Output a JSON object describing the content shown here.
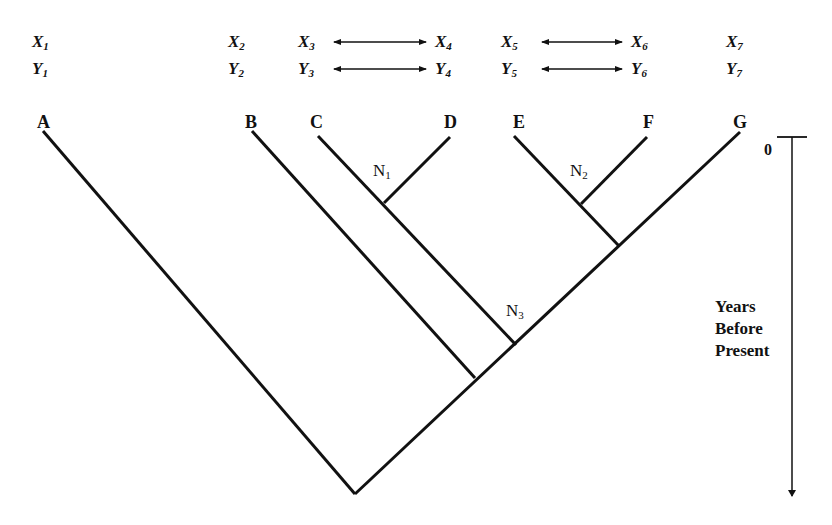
{
  "traits": [
    {
      "id": "t1",
      "x_label": "X",
      "y_label": "Y",
      "sub": "1",
      "left": 32
    },
    {
      "id": "t2",
      "x_label": "X",
      "y_label": "Y",
      "sub": "2",
      "left": 228
    },
    {
      "id": "t3",
      "x_label": "X",
      "y_label": "Y",
      "sub": "3",
      "left": 298
    },
    {
      "id": "t4",
      "x_label": "X",
      "y_label": "Y",
      "sub": "4",
      "left": 435
    },
    {
      "id": "t5",
      "x_label": "X",
      "y_label": "Y",
      "sub": "5",
      "left": 501
    },
    {
      "id": "t6",
      "x_label": "X",
      "y_label": "Y",
      "sub": "6",
      "left": 631
    },
    {
      "id": "t7",
      "x_label": "X",
      "y_label": "Y",
      "sub": "7",
      "left": 726
    }
  ],
  "trait_links": [
    {
      "from": "3",
      "to": "4"
    },
    {
      "from": "5",
      "to": "6"
    }
  ],
  "taxa": [
    {
      "label": "A",
      "left": 37
    },
    {
      "label": "B",
      "left": 245
    },
    {
      "label": "C",
      "left": 310
    },
    {
      "label": "D",
      "left": 444
    },
    {
      "label": "E",
      "left": 513
    },
    {
      "label": "F",
      "left": 643
    },
    {
      "label": "G",
      "left": 733
    }
  ],
  "nodes": {
    "n1": {
      "label": "N",
      "sub": "1"
    },
    "n2": {
      "label": "N",
      "sub": "2"
    },
    "n3": {
      "label": "N",
      "sub": "3"
    }
  },
  "axis": {
    "zero_label": "0",
    "title_line1": "Years",
    "title_line2": "Before",
    "title_line3": "Present"
  },
  "colors": {
    "line": "#111111",
    "background": "#ffffff"
  }
}
